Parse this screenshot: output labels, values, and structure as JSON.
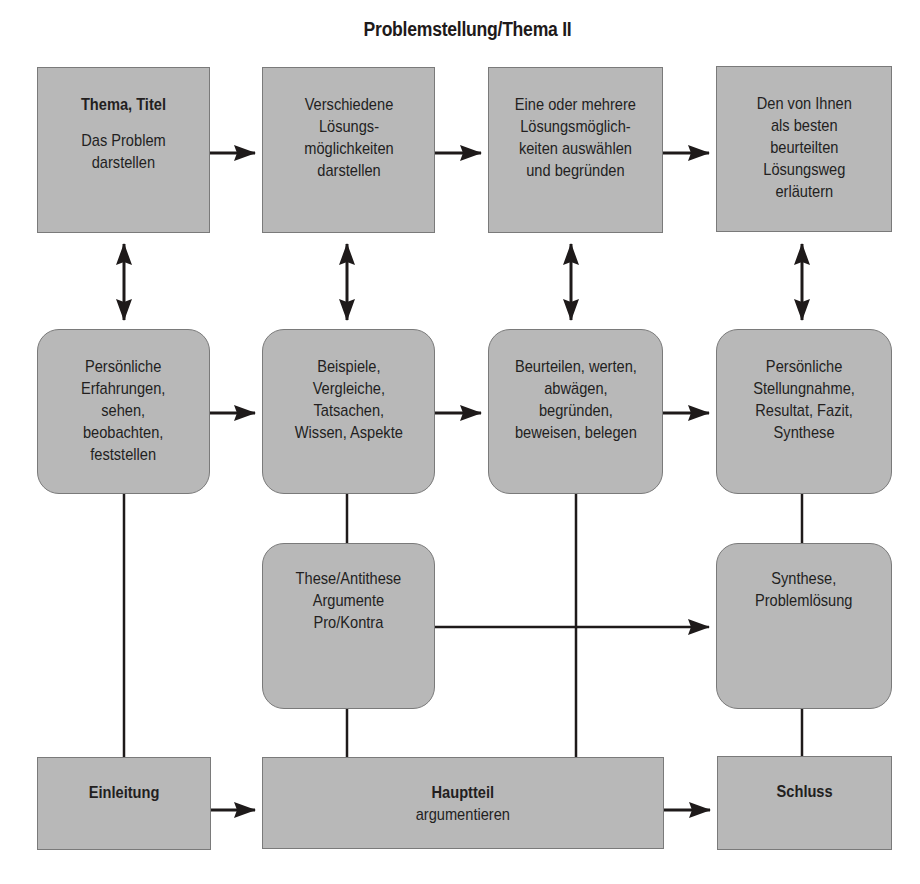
{
  "title": "Problemstellung/Thema II",
  "row1": [
    {
      "heading": "Thema, Titel",
      "lines": [
        "Das Problem",
        "darstellen"
      ]
    },
    {
      "lines": [
        "Verschiedene",
        "Lösungs-",
        "möglichkeiten",
        "darstellen"
      ]
    },
    {
      "lines": [
        "Eine oder mehrere",
        "Lösungsmöglich-",
        "keiten auswählen",
        "und begründen"
      ]
    },
    {
      "lines": [
        "Den von Ihnen",
        "als besten",
        "beurteilten",
        "Lösungsweg",
        "erläutern"
      ]
    }
  ],
  "row2": [
    {
      "lines": [
        "Persönliche",
        "Erfahrungen,",
        "sehen,",
        "beobachten,",
        "feststellen"
      ]
    },
    {
      "lines": [
        "Beispiele,",
        "Vergleiche,",
        "Tatsachen,",
        "Wissen, Aspekte"
      ]
    },
    {
      "lines": [
        "Beurteilen, werten,",
        "abwägen,",
        "begründen,",
        "beweisen, belegen"
      ]
    },
    {
      "lines": [
        "Persönliche",
        "Stellungnahme,",
        "Resultat, Fazit,",
        "Synthese"
      ]
    }
  ],
  "row3": [
    {
      "lines": [
        "These/Antithese",
        "Argumente",
        "Pro/Kontra"
      ]
    },
    {
      "lines": [
        "Synthese,",
        "Problemlösung"
      ]
    }
  ],
  "row4": [
    {
      "heading": "Einleitung"
    },
    {
      "heading": "Hauptteil",
      "lines": [
        "argumentieren"
      ]
    },
    {
      "heading": "Schluss"
    }
  ],
  "colors": {
    "box_fill": "#b8b8b8",
    "box_border": "#7a7a7a",
    "line": "#1e1a1a"
  }
}
